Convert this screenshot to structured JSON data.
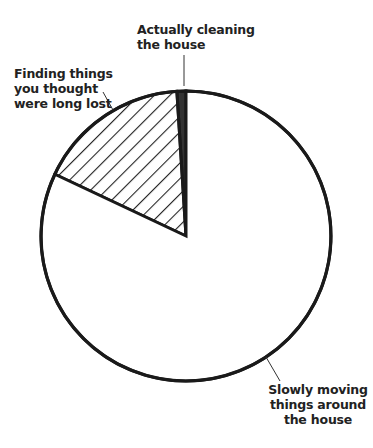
{
  "chart_data": {
    "type": "pie",
    "title": "",
    "start_angle_deg": 0,
    "direction": "counterclockwise",
    "slices": [
      {
        "label": "Actually cleaning the house",
        "value": 1,
        "fill": "dark-solid",
        "color": "#333333"
      },
      {
        "label": "Finding things you thought were long lost",
        "value": 17,
        "fill": "diagonal-hatch",
        "color": "#222222"
      },
      {
        "label": "Slowly moving things around the house",
        "value": 82,
        "fill": "white",
        "color": "#ffffff"
      }
    ],
    "legend": "none",
    "annotations": [
      "leader lines from labels to slices"
    ]
  },
  "labels": {
    "cleaning": "Actually cleaning\nthe house",
    "finding": "Finding things\nyou thought\nwere long lost",
    "slowly": "Slowly moving\nthings around\nthe house"
  }
}
